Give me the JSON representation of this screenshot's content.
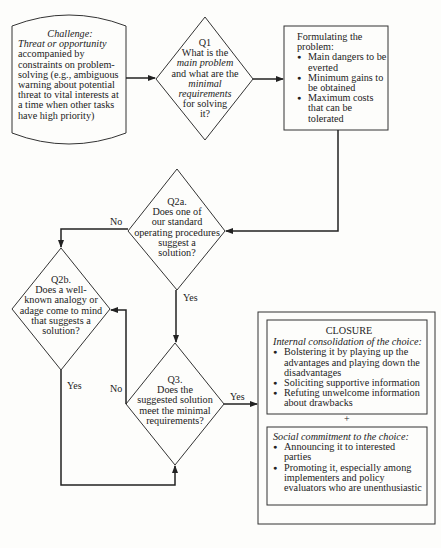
{
  "challenge": {
    "title": "Challenge:",
    "subtitle": "Threat or opportunity",
    "body": "accompanied by constraints on problem-solving (e.g., ambiguous warning about potential threat to vital interests at a time when other tasks have high priority)"
  },
  "q1": {
    "label": "Q1",
    "line1": "What is the",
    "line2_italic": "main problem",
    "line3": "and what are the",
    "line4_italic": "minimal",
    "line5_italic": "requirements",
    "line6": "for solving",
    "line7": "it?"
  },
  "formulating": {
    "title": "Formulating the problem:",
    "items": [
      "Main dangers to be everted",
      "Minimum gains to be obtained",
      "Maximum costs that can be tolerated"
    ]
  },
  "q2a": {
    "label": "Q2a.",
    "text": [
      "Does one of",
      "our standard",
      "operating procedures",
      "suggest a",
      "solution?"
    ]
  },
  "q2b": {
    "label": "Q2b.",
    "text": [
      "Does a well-",
      "known analogy or",
      "adage come to mind",
      "that suggests a",
      "solution?"
    ]
  },
  "q3": {
    "label": "Q3.",
    "text": [
      "Does the",
      "suggested solution",
      "meet the minimal",
      "requirements?"
    ]
  },
  "edges": {
    "q2a_no": "No",
    "q2a_yes": "Yes",
    "q2b_yes": "Yes",
    "q3_no": "No",
    "q3_yes": "Yes"
  },
  "closure": {
    "title": "CLOSURE",
    "internal_heading": "Internal consolidation of the choice:",
    "internal_items": [
      "Bolstering it by playing up the advantages and playing down the disadvantages",
      "Soliciting supportive information",
      "Refuting unwelcome information about drawbacks"
    ],
    "plus": "+",
    "social_heading": "Social commitment to the choice:",
    "social_items": [
      "Announcing it to interested parties",
      "Promoting it, especially among implementers and policy evaluators who are unenthusiastic"
    ]
  }
}
